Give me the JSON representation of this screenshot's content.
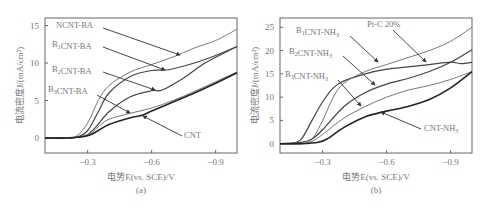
{
  "chart_data": [
    {
      "panel": "(a)",
      "type": "line",
      "xlabel": "电势E(vs. SCE)/V",
      "ylabel": "电流密度J/(mA/cm²)",
      "xticks": [
        "-0.3",
        "-0.6",
        "-0.9"
      ],
      "yticks": [
        "0",
        "5",
        "10",
        "15"
      ],
      "xlim": [
        -0.1,
        -1.0
      ],
      "ylim": [
        -2,
        16
      ],
      "series": [
        {
          "name": "NCNT-BA",
          "x": [
            -0.1,
            -0.2,
            -0.25,
            -0.3,
            -0.35,
            -0.4,
            -0.5,
            -0.6,
            -0.7,
            -0.8,
            -0.9,
            -1.0
          ],
          "y": [
            0,
            0,
            0.3,
            2,
            5,
            7,
            8.8,
            9.8,
            10.8,
            12,
            13,
            14.5
          ]
        },
        {
          "name": "B1CNT-BA",
          "x": [
            -0.1,
            -0.2,
            -0.25,
            -0.3,
            -0.35,
            -0.4,
            -0.5,
            -0.6,
            -0.68,
            -0.8,
            -0.9,
            -1.0
          ],
          "y": [
            0,
            0,
            0.1,
            1,
            3.5,
            6,
            8.2,
            9,
            9.1,
            10,
            11,
            12.2
          ]
        },
        {
          "name": "B2CNT-BA",
          "x": [
            -0.1,
            -0.2,
            -0.28,
            -0.33,
            -0.4,
            -0.5,
            -0.6,
            -0.65,
            -0.75,
            -0.85,
            -1.0
          ],
          "y": [
            0,
            0,
            0.2,
            1.2,
            3.5,
            5.5,
            6.3,
            6.4,
            8,
            10,
            12.2
          ]
        },
        {
          "name": "B3CNT-BA",
          "x": [
            -0.1,
            -0.2,
            -0.3,
            -0.35,
            -0.4,
            -0.5,
            -0.6,
            -0.7,
            -0.8,
            -0.9,
            -1.0
          ],
          "y": [
            0,
            0,
            0.4,
            1.5,
            2.5,
            3.3,
            4,
            5,
            6.2,
            7.5,
            8.8
          ]
        },
        {
          "name": "CNT",
          "x": [
            -0.1,
            -0.2,
            -0.3,
            -0.35,
            -0.4,
            -0.5,
            -0.55,
            -0.6,
            -0.7,
            -0.8,
            -0.9,
            -1.0
          ],
          "y": [
            0,
            0,
            0.3,
            1,
            1.8,
            2.7,
            3,
            3.6,
            4.8,
            6,
            7.3,
            8.7
          ]
        }
      ]
    },
    {
      "panel": "(b)",
      "type": "line",
      "xlabel": "电势E(vs. SCE)/V",
      "ylabel": "电流密度J/(mA/cm²)",
      "xticks": [
        "-0.3",
        "-0.6",
        "-0.9"
      ],
      "yticks": [
        "0",
        "5",
        "10",
        "15",
        "20",
        "25"
      ],
      "xlim": [
        -0.1,
        -1.0
      ],
      "ylim": [
        -2,
        27
      ],
      "series": [
        {
          "name": "Pt-C 20%",
          "x": [
            -0.1,
            -0.15,
            -0.2,
            -0.25,
            -0.3,
            -0.35,
            -0.4,
            -0.5,
            -0.6,
            -0.7,
            -0.8,
            -0.9,
            -0.95,
            -1.0
          ],
          "y": [
            0,
            0,
            1,
            5,
            9,
            12,
            13.5,
            15,
            16,
            16.5,
            17,
            17.5,
            17.2,
            17.5
          ]
        },
        {
          "name": "B1CNT-NH3",
          "x": [
            -0.1,
            -0.2,
            -0.25,
            -0.3,
            -0.35,
            -0.4,
            -0.5,
            -0.6,
            -0.7,
            -0.8,
            -0.9,
            -1.0
          ],
          "y": [
            0,
            0,
            1,
            5,
            10,
            13,
            15.5,
            17,
            18.5,
            20,
            22,
            25
          ]
        },
        {
          "name": "B2CNT-NH3",
          "x": [
            -0.1,
            -0.2,
            -0.25,
            -0.3,
            -0.4,
            -0.5,
            -0.6,
            -0.7,
            -0.8,
            -0.9,
            -1.0
          ],
          "y": [
            0,
            0.3,
            1,
            3,
            8,
            11,
            12.8,
            14,
            15.5,
            17.5,
            20.2
          ]
        },
        {
          "name": "B3CNT-NH3",
          "x": [
            -0.1,
            -0.2,
            -0.25,
            -0.3,
            -0.4,
            -0.5,
            -0.6,
            -0.7,
            -0.8,
            -0.9,
            -1.0
          ],
          "y": [
            0,
            0,
            0.5,
            2,
            5.5,
            8,
            10,
            11.5,
            12.5,
            13.8,
            15.5
          ]
        },
        {
          "name": "CNT-NH3",
          "x": [
            -0.1,
            -0.2,
            -0.28,
            -0.32,
            -0.4,
            -0.5,
            -0.6,
            -0.7,
            -0.8,
            -0.9,
            -1.0
          ],
          "y": [
            0,
            0,
            0.3,
            1,
            3.5,
            5.8,
            7,
            8,
            9.5,
            12,
            15.5
          ]
        }
      ]
    }
  ],
  "panels": {
    "a": {
      "caption": "(a)",
      "xlabel_prefix": "电势",
      "xlabel_var": "E",
      "xlabel_suffix": "(vs. SCE)/V",
      "ylabel": "电流密度J/(mA/cm²)",
      "labels": [
        "NCNT-BA",
        "B1CNT-BA",
        "B2CNT-BA",
        "B3CNT-BA",
        "CNT"
      ]
    },
    "b": {
      "caption": "(b)",
      "labels": [
        "B1CNT-NH3",
        "B2CNT-NH3",
        "B3CNT-NH3",
        "Pt-C 20%",
        "CNT-NH3"
      ]
    }
  }
}
